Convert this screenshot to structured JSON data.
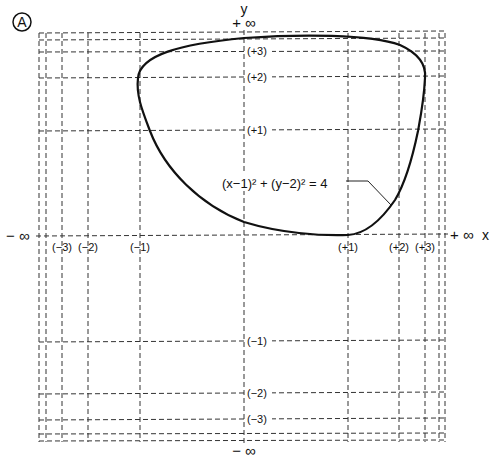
{
  "figure": {
    "badge": "A",
    "equation": "(x−1)² + (y−2)² = 4",
    "x_axis": {
      "name": "x",
      "neg_infinity": "− ∞",
      "pos_infinity": "+ ∞",
      "ticks": [
        "(−3)",
        "(−2)",
        "(−1)",
        "(+1)",
        "(+2)",
        "(+3)"
      ]
    },
    "y_axis": {
      "name": "y",
      "pos_infinity": "+ ∞",
      "neg_infinity": "− ∞",
      "ticks": [
        "(+3)",
        "(+2)",
        "(+1)",
        "(−1)",
        "(−2)",
        "(−3)"
      ]
    }
  }
}
